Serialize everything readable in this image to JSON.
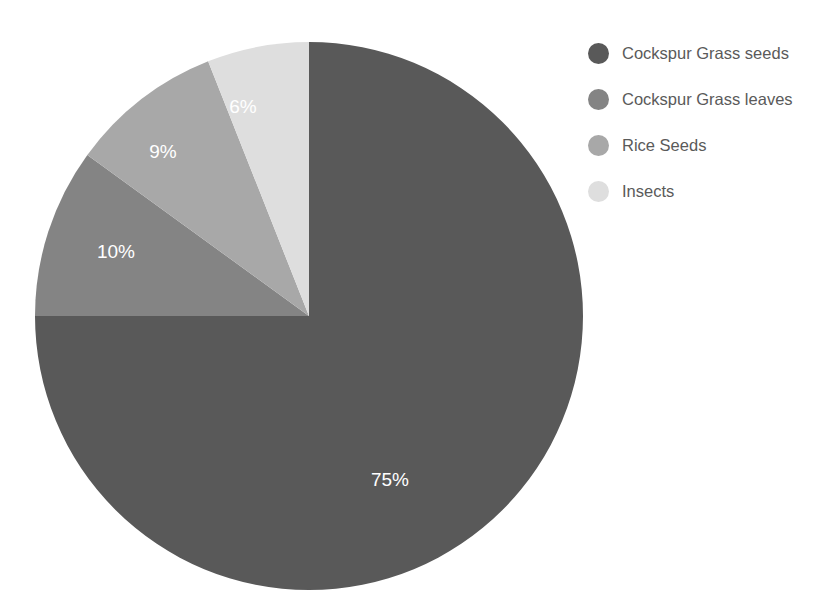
{
  "chart_data": {
    "type": "pie",
    "title": "",
    "legend_position": "right",
    "start_angle_deg": 0,
    "direction": "counterclockwise",
    "categories": [
      "Cockspur Grass seeds",
      "Cockspur Grass leaves",
      "Rice Seeds",
      "Insects"
    ],
    "values": [
      75,
      10,
      9,
      6
    ],
    "value_unit": "%",
    "colors": [
      "#595959",
      "#848484",
      "#a8a8a8",
      "#dedede"
    ],
    "slices": [
      {
        "label": "Cockspur Grass seeds",
        "value": 75,
        "display": "75%",
        "color": "#595959",
        "label_x": 390,
        "label_y": 481
      },
      {
        "label": "Cockspur Grass leaves",
        "value": 10,
        "display": "10%",
        "color": "#848484",
        "label_x": 116,
        "label_y": 253
      },
      {
        "label": "Rice Seeds",
        "value": 9,
        "display": "9%",
        "color": "#a8a8a8",
        "label_x": 163,
        "label_y": 153
      },
      {
        "label": "Insects",
        "value": 6,
        "display": "6%",
        "color": "#dedede",
        "label_x": 243,
        "label_y": 108
      }
    ],
    "geometry": {
      "cx": 309,
      "cy": 316,
      "r": 274
    },
    "label_color": "#ffffff",
    "background": "#ffffff"
  },
  "legend": {
    "items": [
      {
        "label": "Cockspur Grass seeds",
        "color": "#595959"
      },
      {
        "label": "Cockspur Grass leaves",
        "color": "#848484"
      },
      {
        "label": "Rice Seeds",
        "color": "#a8a8a8"
      },
      {
        "label": "Insects",
        "color": "#dedede"
      }
    ]
  }
}
